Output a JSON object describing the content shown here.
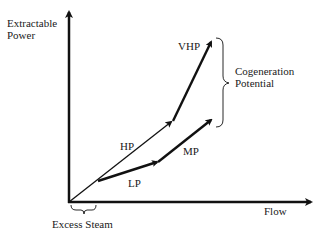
{
  "axes": {
    "y_label_line1": "Extractable",
    "y_label_line2": "Power",
    "x_label": "Flow"
  },
  "segments": {
    "hp": "HP",
    "lp": "LP",
    "mp": "MP",
    "vhp": "VHP"
  },
  "annotations": {
    "cogeneration_line1": "Cogeneration",
    "cogeneration_line2": "Potential",
    "excess_steam": "Excess Steam"
  },
  "colors": {
    "stroke": "#111111",
    "background": "#ffffff"
  }
}
